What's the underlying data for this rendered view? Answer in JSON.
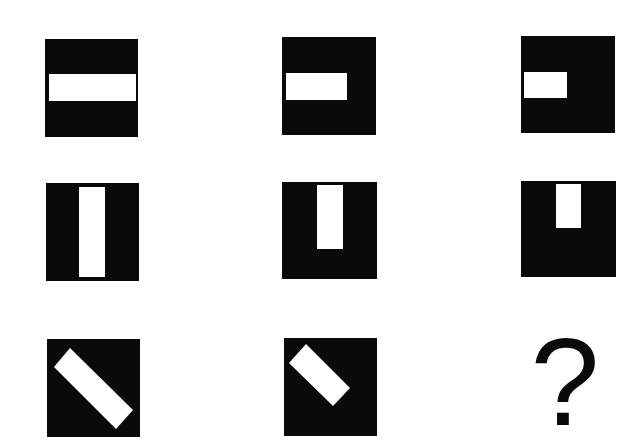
{
  "puzzle": {
    "description": "3x3 matrix reasoning puzzle: black squares containing white bars; bar shrinks across each row",
    "colors": {
      "background": "#ffffff",
      "square": "#0a0a0a",
      "bar": "#ffffff"
    },
    "rows": [
      {
        "orientation": "horizontal",
        "cells": [
          {
            "label": "horizontal-bar-full",
            "box": [
              45,
              39,
              93,
              98
            ],
            "bar": [
              49,
              74,
              87,
              27
            ]
          },
          {
            "label": "horizontal-bar-two-thirds",
            "box": [
              282,
              37,
              94,
              98
            ],
            "bar": [
              286,
              73,
              61,
              27
            ]
          },
          {
            "label": "horizontal-bar-half",
            "box": [
              521,
              36,
              94,
              97
            ],
            "bar": [
              524,
              72,
              43,
              26
            ]
          }
        ]
      },
      {
        "orientation": "vertical",
        "cells": [
          {
            "label": "vertical-bar-full",
            "box": [
              46,
              183,
              93,
              98
            ],
            "bar": [
              79,
              187,
              26,
              90
            ]
          },
          {
            "label": "vertical-bar-two-thirds",
            "box": [
              282,
              182,
              95,
              97
            ],
            "bar": [
              317,
              185,
              26,
              64
            ]
          },
          {
            "label": "vertical-bar-half",
            "box": [
              521,
              181,
              95,
              96
            ],
            "bar": [
              556,
              184,
              25,
              44
            ]
          }
        ]
      },
      {
        "orientation": "diagonal",
        "cells": [
          {
            "label": "diagonal-bar-full",
            "box": [
              47,
              339,
              93,
              98
            ]
          },
          {
            "label": "diagonal-bar-two-thirds",
            "box": [
              284,
              338,
              93,
              98
            ]
          },
          {
            "label": "missing",
            "symbol": "?"
          }
        ]
      }
    ],
    "question_mark": "?"
  }
}
